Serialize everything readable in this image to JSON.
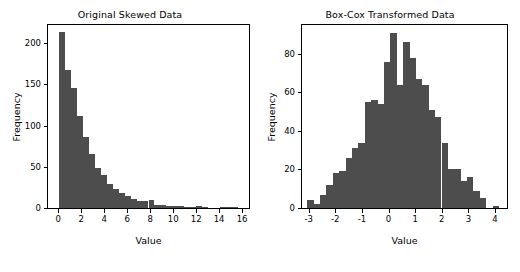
{
  "figure": {
    "background_color": "#ffffff",
    "bar_color": "#4d4d4d",
    "axis_color": "#000000",
    "width": 520,
    "height": 272
  },
  "panels": [
    {
      "id": "original",
      "title": "Original Skewed Data",
      "xlabel": "Value",
      "ylabel": "Frequency"
    },
    {
      "id": "boxcox",
      "title": "Box-Cox Transformed Data",
      "xlabel": "Value",
      "ylabel": "Frequency"
    }
  ],
  "chart_data": [
    {
      "type": "bar",
      "subplot": "left",
      "title": "Original Skewed Data",
      "xlabel": "Value",
      "ylabel": "Frequency",
      "grid": false,
      "legend": null,
      "xlim": [
        -0.9,
        16.6
      ],
      "ylim": [
        0,
        222
      ],
      "xticks": [
        0,
        2,
        4,
        6,
        8,
        10,
        12,
        14,
        16
      ],
      "xtick_labels": [
        "0",
        "2",
        "4",
        "6",
        "8",
        "10",
        "12",
        "14",
        "16"
      ],
      "yticks": [
        0,
        50,
        100,
        150,
        200
      ],
      "ytick_labels": [
        "0",
        "50",
        "100",
        "150",
        "200"
      ],
      "bin_width": 0.52,
      "bin_edges": [
        0.05,
        0.57,
        1.09,
        1.61,
        2.13,
        2.65,
        3.17,
        3.69,
        4.21,
        4.73,
        5.25,
        5.77,
        6.29,
        6.81,
        7.33,
        7.85,
        8.37,
        8.89,
        9.41,
        9.93,
        10.45,
        10.97,
        11.49,
        12.01,
        12.53,
        13.05,
        13.57,
        14.09,
        14.61,
        15.13,
        15.65,
        16.17
      ],
      "values": [
        214,
        167,
        146,
        112,
        86,
        66,
        48,
        40,
        29,
        23,
        18,
        14,
        11,
        8,
        9,
        10,
        4,
        4,
        3,
        2,
        2,
        1,
        1,
        2,
        1,
        0,
        0,
        1,
        1,
        1,
        0
      ]
    },
    {
      "type": "bar",
      "subplot": "right",
      "title": "Box-Cox Transformed Data",
      "xlabel": "Value",
      "ylabel": "Frequency",
      "grid": false,
      "legend": null,
      "xlim": [
        -3.25,
        4.45
      ],
      "ylim": [
        0,
        95
      ],
      "xticks": [
        -3,
        -2,
        -1,
        0,
        1,
        2,
        3,
        4
      ],
      "xtick_labels": [
        "-3",
        "-2",
        "-1",
        "0",
        "1",
        "2",
        "3",
        "4"
      ],
      "yticks": [
        0,
        20,
        40,
        60,
        80
      ],
      "ytick_labels": [
        "0",
        "20",
        "40",
        "60",
        "80"
      ],
      "bin_width": 0.24,
      "bin_edges": [
        -3.05,
        -2.81,
        -2.57,
        -2.33,
        -2.09,
        -1.85,
        -1.61,
        -1.37,
        -1.13,
        -0.89,
        -0.65,
        -0.41,
        -0.17,
        0.07,
        0.31,
        0.55,
        0.79,
        1.03,
        1.27,
        1.51,
        1.75,
        1.99,
        2.23,
        2.47,
        2.71,
        2.95,
        3.19,
        3.43,
        3.67,
        3.91,
        4.15
      ],
      "values": [
        4,
        2,
        7,
        12,
        18,
        19,
        26,
        31,
        34,
        55,
        56,
        54,
        76,
        91,
        64,
        86,
        78,
        67,
        64,
        51,
        47,
        34,
        20,
        20,
        14,
        16,
        9,
        5,
        0,
        1,
        1
      ]
    }
  ]
}
